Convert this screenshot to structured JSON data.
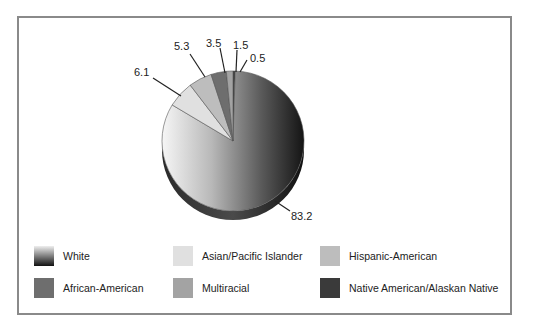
{
  "chart_data": {
    "type": "pie",
    "title": "",
    "style": "3d",
    "categories": [
      "White",
      "Asian/Pacific Islander",
      "Hispanic-American",
      "African-American",
      "Multiracial",
      "Native American/Alaskan Native"
    ],
    "values": [
      83.2,
      6.1,
      5.3,
      3.5,
      1.5,
      0.5
    ],
    "data_labels": [
      "83.2",
      "6.1",
      "5.3",
      "3.5",
      "1.5",
      "0.5"
    ],
    "legend_position": "bottom",
    "colors": {
      "White": "gradient #f4f4f4 to #1a1a1a",
      "Asian/Pacific Islander": "#e2e2e2",
      "Hispanic-American": "#bdbdbd",
      "African-American": "#6e6e6e",
      "Multiracial": "#a3a3a3",
      "Native American/Alaskan Native": "#3a3a3a"
    }
  },
  "labels": {
    "white": "83.2",
    "asian": "6.1",
    "hispanic": "5.3",
    "african": "3.5",
    "multiracial": "1.5",
    "native": "0.5"
  },
  "legend": [
    {
      "label": "White"
    },
    {
      "label": "Asian/Pacific Islander"
    },
    {
      "label": "Hispanic-American"
    },
    {
      "label": "African-American"
    },
    {
      "label": "Multiracial"
    },
    {
      "label": "Native American/Alaskan Native"
    }
  ]
}
